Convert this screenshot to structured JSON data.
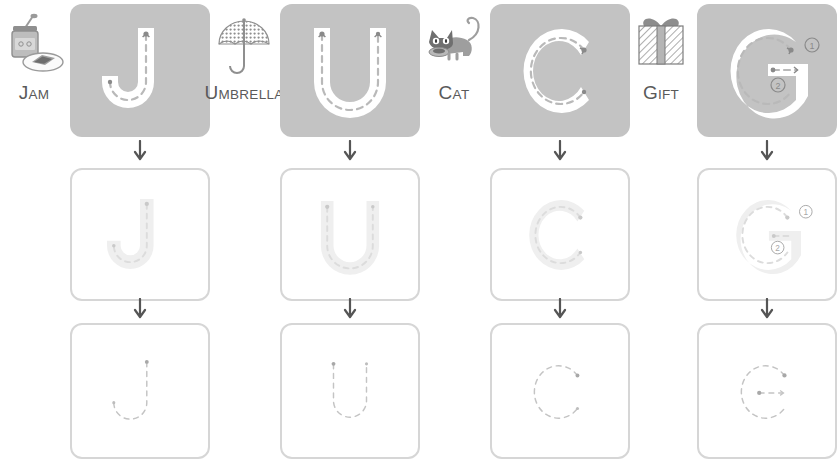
{
  "page": {
    "columns_count": 4,
    "rows_count": 3
  },
  "colors": {
    "card_gray": "#c3c3c3",
    "card_border": "#d6d6d6",
    "letter_white": "#ffffff",
    "letter_ghost": "#ededed",
    "dash_gray": "#b0b0b0",
    "dash_light": "#d0d0d0",
    "label_text": "#5a5a5a",
    "arrow": "#555555"
  },
  "columns": [
    {
      "letter": "J",
      "word": {
        "first": "J",
        "rest": "AM",
        "full": "JAM"
      },
      "icon_name": "jam-jar-and-toast-icon",
      "stroke_numbers": [],
      "rows": [
        {
          "style": "solid-white-on-gray",
          "label": "row-1-J"
        },
        {
          "style": "ghost-outline",
          "label": "row-2-J"
        },
        {
          "style": "dashed-path-only",
          "label": "row-3-J"
        }
      ]
    },
    {
      "letter": "U",
      "word": {
        "first": "U",
        "rest": "MBRELLA",
        "full": "UMBRELLA"
      },
      "icon_name": "umbrella-icon",
      "stroke_numbers": [],
      "rows": [
        {
          "style": "solid-white-on-gray",
          "label": "row-1-U"
        },
        {
          "style": "ghost-outline",
          "label": "row-2-U"
        },
        {
          "style": "dashed-path-only",
          "label": "row-3-U"
        }
      ]
    },
    {
      "letter": "C",
      "word": {
        "first": "C",
        "rest": "AT",
        "full": "CAT"
      },
      "icon_name": "cat-icon",
      "stroke_numbers": [],
      "rows": [
        {
          "style": "solid-white-on-gray",
          "label": "row-1-C"
        },
        {
          "style": "ghost-outline",
          "label": "row-2-C"
        },
        {
          "style": "dashed-path-only",
          "label": "row-3-C"
        }
      ]
    },
    {
      "letter": "G",
      "word": {
        "first": "G",
        "rest": "IFT",
        "full": "GIFT"
      },
      "icon_name": "gift-box-icon",
      "stroke_numbers": [
        "①",
        "②"
      ],
      "rows": [
        {
          "style": "solid-white-on-gray",
          "label": "row-1-G"
        },
        {
          "style": "ghost-outline",
          "label": "row-2-G"
        },
        {
          "style": "dashed-path-only",
          "label": "row-3-G"
        }
      ]
    }
  ],
  "arrows": {
    "glyph": "↓",
    "name": "down-arrow"
  }
}
